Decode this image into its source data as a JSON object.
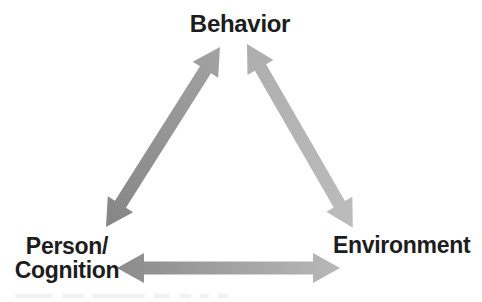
{
  "figure": {
    "type": "diagram",
    "nodes": {
      "behavior": {
        "label": "Behavior"
      },
      "person_cognition": {
        "line1": "Person/",
        "line2": "Cognition"
      },
      "environment": {
        "label": "Environment"
      }
    },
    "edges": [
      {
        "from": "behavior",
        "to": "person_cognition",
        "direction": "bidirectional",
        "style": "thick gray double-headed arrow"
      },
      {
        "from": "behavior",
        "to": "environment",
        "direction": "bidirectional",
        "style": "thick light-gray double-headed arrow"
      },
      {
        "from": "person_cognition",
        "to": "environment",
        "direction": "bidirectional",
        "style": "thick gray double-headed arrow, darker at left"
      }
    ],
    "colors": {
      "background": "#ffffff",
      "text": "#1d1d1d",
      "arrow_dark": "#888888",
      "arrow_mid": "#a2a2a2",
      "arrow_light": "#bcbcbc"
    }
  }
}
